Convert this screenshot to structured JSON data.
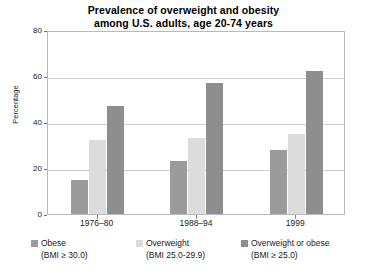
{
  "chart_data": {
    "type": "bar",
    "title": "Prevalence of overweight and obesity among U.S. adults, age 20-74 years",
    "title_line1": "Prevalence of overweight and obesity",
    "title_line2": "among U.S. adults, age 20-74 years",
    "xlabel": "",
    "ylabel": "Percentage",
    "ylim": [
      0,
      80
    ],
    "yticks": [
      0,
      20,
      40,
      60,
      80
    ],
    "grid": true,
    "legend_position": "bottom",
    "categories": [
      "1976–80",
      "1988–94",
      "1999"
    ],
    "series": [
      {
        "name": "Obese",
        "sublabel": "(BMI ≥ 30.0)",
        "color": "#9b9b9b",
        "values": [
          15,
          23,
          28
        ]
      },
      {
        "name": "Overweight",
        "sublabel": "(BMI 25.0-29.9)",
        "color": "#dcdcdc",
        "values": [
          32,
          33,
          35
        ]
      },
      {
        "name": "Overweight or obese",
        "sublabel": "(BMI ≥ 25.0)",
        "color": "#8e8e8e",
        "values": [
          47,
          57,
          62
        ]
      }
    ]
  },
  "axis": {
    "y_tick_labels": [
      "0",
      "20",
      "40",
      "60",
      "80"
    ],
    "y_title": "Percentage"
  }
}
